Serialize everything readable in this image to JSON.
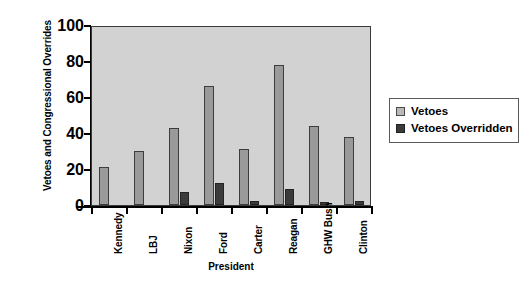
{
  "chart_data": {
    "type": "bar",
    "title": "",
    "xlabel": "President",
    "ylabel": "Vetoes and Congressional Overrides",
    "categories": [
      "Kennedy",
      "LBJ",
      "Nixon",
      "Ford",
      "Carter",
      "Reagan",
      "GHW Bush",
      "Clinton"
    ],
    "series": [
      {
        "name": "Vetoes",
        "color": "#9a9a9a",
        "values": [
          21,
          30,
          43,
          66,
          31,
          78,
          44,
          38
        ]
      },
      {
        "name": "Vetoes Overridden",
        "color": "#3b3b3b",
        "values": [
          0,
          0,
          7,
          12,
          2,
          9,
          1,
          2
        ]
      }
    ],
    "ylim": [
      0,
      100
    ],
    "yticks": [
      0,
      20,
      40,
      60,
      80,
      100
    ],
    "ytick_labels": [
      "0",
      "20",
      "40",
      "60",
      "80",
      "100"
    ],
    "grid": false,
    "legend_position": "right",
    "plot_background": "#d2d2d2"
  },
  "legend": {
    "entries": [
      {
        "label": "Vetoes",
        "swatch": "light-gray-square-icon"
      },
      {
        "label": "Vetoes Overridden",
        "swatch": "dark-gray-square-icon"
      }
    ]
  }
}
